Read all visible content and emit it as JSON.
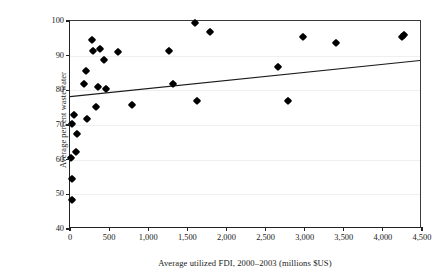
{
  "chart_data": {
    "type": "scatter",
    "title": "",
    "xlabel": "Average utilized FDI, 2000–2003 (millions $US)",
    "ylabel": "Average percent wastewater\nmeeting discharge standard 2000–2003",
    "xlim": [
      0,
      4500
    ],
    "ylim": [
      40,
      100
    ],
    "xticks": [
      0,
      500,
      1000,
      1500,
      2000,
      2500,
      3000,
      3500,
      4000,
      4500
    ],
    "xticklabels": [
      "0",
      "500",
      "1,000",
      "1,500",
      "2,000",
      "2,500",
      "3,000",
      "3,500",
      "4,000",
      "4,500"
    ],
    "yticks": [
      40,
      50,
      60,
      70,
      80,
      90,
      100
    ],
    "yticklabels": [
      "40",
      "50",
      "60",
      "70",
      "80",
      "90",
      "100"
    ],
    "grid": "horizontal",
    "legend": "none",
    "marker": "diamond",
    "marker_color": "#000000",
    "points": [
      {
        "x": 20,
        "y": 48.3
      },
      {
        "x": 25,
        "y": 54.5
      },
      {
        "x": 15,
        "y": 60.6
      },
      {
        "x": 75,
        "y": 62.2
      },
      {
        "x": 95,
        "y": 67.5
      },
      {
        "x": 25,
        "y": 70.3
      },
      {
        "x": 55,
        "y": 73.0
      },
      {
        "x": 215,
        "y": 71.8
      },
      {
        "x": 330,
        "y": 75.2
      },
      {
        "x": 790,
        "y": 75.8
      },
      {
        "x": 1620,
        "y": 77.0
      },
      {
        "x": 2790,
        "y": 76.9
      },
      {
        "x": 185,
        "y": 81.7
      },
      {
        "x": 360,
        "y": 81.0
      },
      {
        "x": 455,
        "y": 80.3
      },
      {
        "x": 210,
        "y": 85.5
      },
      {
        "x": 440,
        "y": 88.7
      },
      {
        "x": 290,
        "y": 91.3
      },
      {
        "x": 620,
        "y": 91.0
      },
      {
        "x": 1270,
        "y": 91.3
      },
      {
        "x": 380,
        "y": 92.0
      },
      {
        "x": 285,
        "y": 94.5
      },
      {
        "x": 1320,
        "y": 81.8
      },
      {
        "x": 2660,
        "y": 86.6
      },
      {
        "x": 2980,
        "y": 95.3
      },
      {
        "x": 3400,
        "y": 93.6
      },
      {
        "x": 4250,
        "y": 95.3
      },
      {
        "x": 4270,
        "y": 96.0
      },
      {
        "x": 1600,
        "y": 99.5
      },
      {
        "x": 1790,
        "y": 96.8
      }
    ],
    "trendline": {
      "type": "linear",
      "x_start": 0,
      "y_start": 78.0,
      "x_end": 4500,
      "y_end": 88.5,
      "color": "#1a1a1a"
    }
  }
}
